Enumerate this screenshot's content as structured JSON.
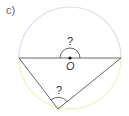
{
  "part_label": "c)",
  "diagram": {
    "type": "circle-geometry",
    "center_label": "O",
    "center_angle_label": "?",
    "inscribed_angle_label": "?",
    "colors": {
      "upper_arc": "#d8dcf0",
      "lower_arc": "#f3f3d0",
      "lines": "#555555",
      "center_dot": "#111111"
    },
    "geometry": {
      "center": [
        70,
        58
      ],
      "radius": 51,
      "diameter_left": [
        19,
        58
      ],
      "diameter_right": [
        121,
        58
      ],
      "inscribed_vertex": [
        58,
        109
      ]
    }
  }
}
